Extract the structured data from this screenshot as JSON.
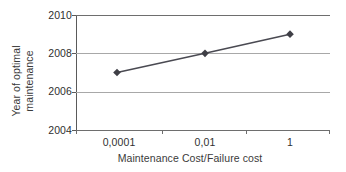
{
  "chart_data": {
    "type": "line",
    "title": "",
    "subtitle": "",
    "xlabel": "Maintenance Cost/Failure cost",
    "ylabel": "Year of optimal maintenance",
    "ylabel_lines": [
      "Year of optimal",
      "maintenance"
    ],
    "x_tick_labels": [
      "0,0001",
      "0,01",
      "1"
    ],
    "x_values": [
      0.0001,
      0.01,
      1
    ],
    "x_scale": "log",
    "y_tick_labels": [
      "2004",
      "2006",
      "2008",
      "2010"
    ],
    "y_ticks": [
      2004,
      2006,
      2008,
      2010
    ],
    "ylim": [
      2004,
      2010
    ],
    "values": [
      2007,
      2008,
      2009
    ],
    "categories": [
      "0,0001",
      "0,01",
      "1"
    ],
    "points": [
      {
        "x_label": "0,0001",
        "x": 0.0001,
        "y": 2007
      },
      {
        "x_label": "0,01",
        "x": 0.01,
        "y": 2008
      },
      {
        "x_label": "1",
        "x": 1,
        "y": 2009
      }
    ],
    "grid": true,
    "grid_axis": "y",
    "legend": false,
    "legend_position": "none",
    "marker": "diamond",
    "annotations": []
  },
  "style": {
    "background": "#ffffff",
    "series_color": "#4a4a52",
    "marker_color": "#3f3f46",
    "gridline_color": "#a8a8a8",
    "axis_color": "#5a5a5a",
    "text_color": "#2f2f2f"
  }
}
